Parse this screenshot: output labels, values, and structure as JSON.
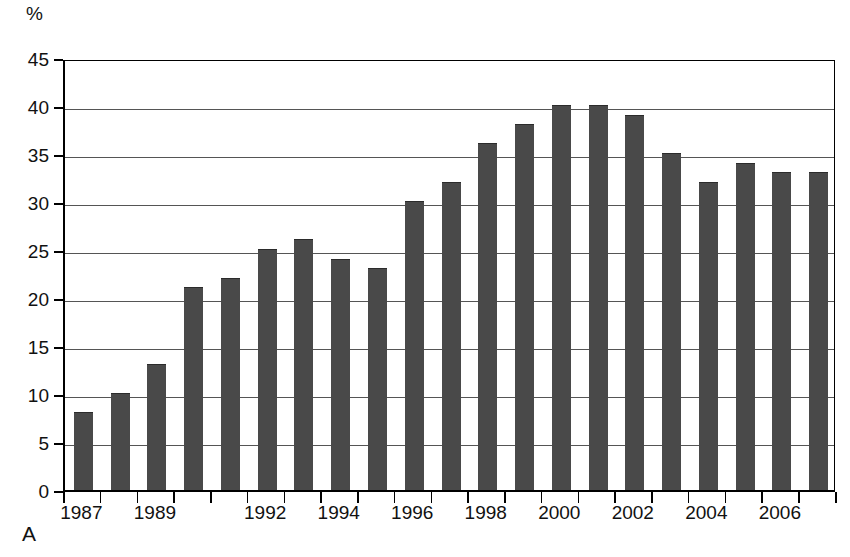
{
  "figure": {
    "panel_letter": "A",
    "unit_label": "%",
    "bar_color": "#494949",
    "grid_color": "#555555",
    "axis_color": "#000000",
    "background": "#ffffff"
  },
  "chart_data": {
    "type": "bar",
    "title": "",
    "subtitle": "",
    "xlabel": "",
    "ylabel": "%",
    "ylim": [
      0,
      45
    ],
    "ytick_step": 5,
    "yticks": [
      "0",
      "5",
      "10",
      "15",
      "20",
      "25",
      "30",
      "35",
      "40",
      "45"
    ],
    "grid": true,
    "legend": null,
    "categories": [
      "1987",
      "1988",
      "1989",
      "1990",
      "1991",
      "1992",
      "1993",
      "1994",
      "1995",
      "1996",
      "1997",
      "1998",
      "1999",
      "2000",
      "2001",
      "2002",
      "2003",
      "2004",
      "2005",
      "2006",
      "2007"
    ],
    "values": [
      8,
      10,
      13,
      21,
      22,
      25,
      26,
      24,
      23,
      30,
      32,
      36,
      38,
      40,
      40,
      39,
      35,
      32,
      34,
      33,
      33
    ],
    "xtick_labels_shown": [
      "1987",
      "1989",
      "1992",
      "1994",
      "1996",
      "1998",
      "2000",
      "2002",
      "2004",
      "2006"
    ],
    "xtick_label_indices": [
      0,
      2,
      5,
      7,
      9,
      11,
      13,
      15,
      17,
      19
    ],
    "annotations": []
  }
}
